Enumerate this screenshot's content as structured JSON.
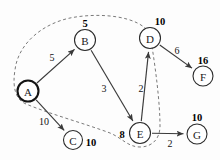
{
  "diagram": {
    "accent_color": "#3a3a3a",
    "dash_color": "#7a7a7a",
    "node_fill": "#ffffff",
    "nodes": [
      {
        "id": "A",
        "label": "A",
        "x": 28,
        "y": 91,
        "r": 10.5,
        "emphasis": "start"
      },
      {
        "id": "B",
        "label": "B",
        "x": 85,
        "y": 40,
        "r": 10.5,
        "emphasis": "normal"
      },
      {
        "id": "C",
        "label": "C",
        "x": 73,
        "y": 140,
        "r": 9.5,
        "emphasis": "normal"
      },
      {
        "id": "D",
        "label": "D",
        "x": 150,
        "y": 38,
        "r": 10.5,
        "emphasis": "normal"
      },
      {
        "id": "E",
        "label": "E",
        "x": 140,
        "y": 133,
        "r": 10.5,
        "emphasis": "normal"
      },
      {
        "id": "F",
        "label": "F",
        "x": 203,
        "y": 76,
        "r": 10.0,
        "emphasis": "normal"
      },
      {
        "id": "G",
        "label": "G",
        "x": 197,
        "y": 134,
        "r": 10.0,
        "emphasis": "normal"
      }
    ],
    "edges": [
      {
        "from": "A",
        "to": "B",
        "weight": "5",
        "wx": 52,
        "wy": 57
      },
      {
        "from": "A",
        "to": "C",
        "weight": "10",
        "wx": 44,
        "wy": 121
      },
      {
        "from": "B",
        "to": "E",
        "weight": "3",
        "wx": 104,
        "wy": 88
      },
      {
        "from": "E",
        "to": "D",
        "weight": "2",
        "wx": 141,
        "wy": 88
      },
      {
        "from": "D",
        "to": "F",
        "weight": "6",
        "wx": 177,
        "wy": 50
      },
      {
        "from": "E",
        "to": "G",
        "weight": "2",
        "wx": 170,
        "wy": 143
      }
    ],
    "distance_labels": [
      {
        "node": "B",
        "value": "5",
        "x": 85,
        "y": 23
      },
      {
        "node": "D",
        "value": "10",
        "x": 160,
        "y": 21
      },
      {
        "node": "F",
        "value": "16",
        "x": 203,
        "y": 60
      },
      {
        "node": "C",
        "value": "10",
        "x": 91,
        "y": 142
      },
      {
        "node": "E",
        "value": "8",
        "x": 122,
        "y": 134
      },
      {
        "node": "G",
        "value": "10",
        "x": 197,
        "y": 117
      }
    ],
    "cut_boundary": {
      "name": "dashed-cut-curve",
      "encloses": [
        "A",
        "B",
        "C",
        "D",
        "E"
      ],
      "path": "M 150 34 C 140 16, 100 12, 70 18 C 42 24, 18 44, 15 70 C 12 88, 16 100, 26 104 C 50 114, 86 124, 110 133 C 122 138, 128 147, 140 147 C 152 147, 160 139, 160 126 C 160 104, 156 70, 150 34 Z"
    }
  }
}
